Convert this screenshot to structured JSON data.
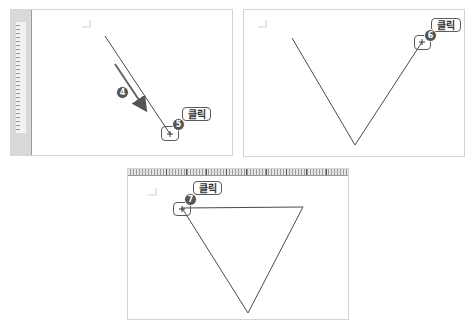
{
  "steps": {
    "step4": {
      "number": "4"
    },
    "step5": {
      "number": "5",
      "label": "클릭"
    },
    "step6": {
      "number": "6",
      "label": "클릭"
    },
    "step7": {
      "number": "7",
      "label": "클릭"
    }
  },
  "colors": {
    "line": "#4a4a4a",
    "badge": "#555555",
    "panel_border": "#d4d4d4",
    "ruler": "#d9d9d9"
  },
  "panels": [
    {
      "name": "panel-step-5",
      "description": "first line drawn diagonally, click endpoint"
    },
    {
      "name": "panel-step-6",
      "description": "V shape drawn, click second endpoint"
    },
    {
      "name": "panel-step-7",
      "description": "triangle closed by clicking start point"
    }
  ]
}
